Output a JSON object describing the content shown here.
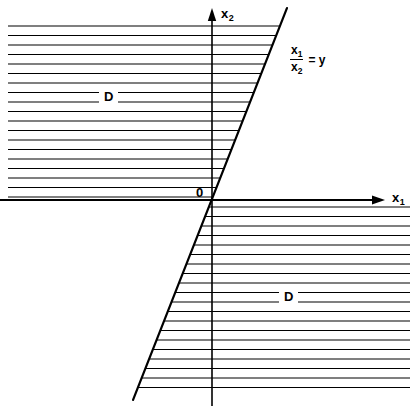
{
  "figure": {
    "width": 418,
    "height": 406,
    "background_color": "#ffffff",
    "ink_color": "#000000"
  },
  "axes": {
    "vertical": {
      "name": "x2",
      "label_main": "x",
      "label_sub": "2",
      "x": 212,
      "y_top": 8,
      "y_bottom": 406,
      "label_x": 221,
      "label_y": 7
    },
    "horizontal": {
      "name": "x1",
      "label_main": "x",
      "label_sub": "1",
      "y": 200,
      "x_left": 0,
      "x_right": 385,
      "label_x": 392,
      "label_y": 191
    },
    "origin": {
      "label": "0",
      "x": 212,
      "y": 200,
      "label_x": 196,
      "label_y": 186
    }
  },
  "boundary_line": {
    "name": "x1/x2 = y",
    "numerator_main": "x",
    "numerator_sub": "1",
    "denominator_main": "x",
    "denominator_sub": "2",
    "equals_rhs": "= y",
    "label_x": 290,
    "label_y": 44,
    "x_top": 287,
    "y_top": 8,
    "x_bottom": 133,
    "y_bottom": 400,
    "slope": -2.545
  },
  "regions": [
    {
      "id": "upper",
      "label": "D",
      "label_x": 104,
      "label_y": 90,
      "hatch_x_start": 8,
      "hatch_y_start": 26,
      "hatch_y_end": 197,
      "hatch_spacing": 9.5,
      "description": "hatched region left of the line, above the x1 axis"
    },
    {
      "id": "lower",
      "label": "D",
      "label_x": 284,
      "label_y": 290,
      "hatch_x_end": 410,
      "hatch_y_start": 207,
      "hatch_y_end": 393,
      "hatch_spacing": 9.5,
      "description": "hatched region right of the line, below the x1 axis"
    }
  ]
}
